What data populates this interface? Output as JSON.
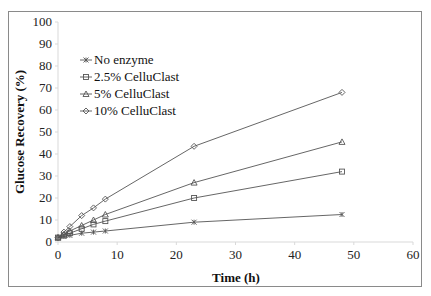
{
  "chart_data": {
    "type": "line",
    "title": "",
    "xlabel": "Time (h)",
    "ylabel": "Glucose Recovery (%)",
    "xlim": [
      0,
      60
    ],
    "ylim": [
      0,
      100
    ],
    "xticks": [
      0,
      10,
      20,
      30,
      40,
      50,
      60
    ],
    "yticks": [
      0,
      10,
      20,
      30,
      40,
      50,
      60,
      70,
      80,
      90,
      100
    ],
    "grid": false,
    "legend_position": "upper left",
    "x": [
      0,
      1,
      2,
      4,
      6,
      8,
      23,
      48
    ],
    "series": [
      {
        "name": "No enzyme",
        "marker": "x",
        "values": [
          2,
          2.5,
          3,
          4,
          4.5,
          5,
          9,
          12.5
        ]
      },
      {
        "name": "2.5% CelluClast",
        "marker": "square",
        "values": [
          2,
          3,
          4,
          6,
          8,
          9.5,
          20,
          32
        ]
      },
      {
        "name": "5% CelluClast",
        "marker": "triangle",
        "values": [
          2,
          3.5,
          5,
          7.5,
          10,
          12.5,
          27,
          45.5
        ]
      },
      {
        "name": "10% CelluClast",
        "marker": "diamond",
        "values": [
          2,
          4.5,
          7,
          12,
          15.5,
          19.5,
          43.5,
          68
        ]
      }
    ]
  }
}
